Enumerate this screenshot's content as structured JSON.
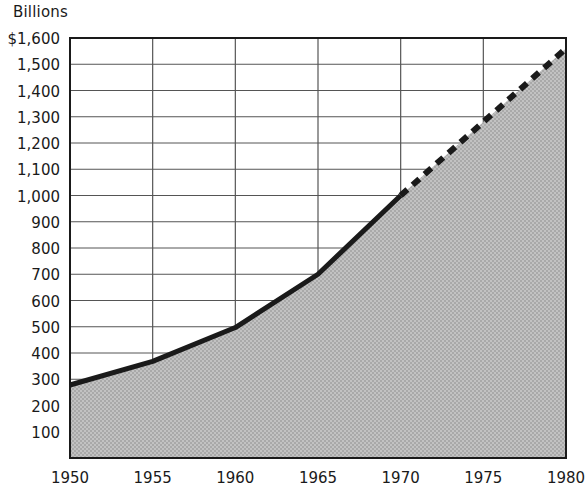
{
  "chart_data": {
    "type": "area",
    "title": "",
    "subtitle": "",
    "units_label": "Billions",
    "xlabel": "",
    "ylabel": "",
    "x": [
      1950,
      1955,
      1960,
      1965,
      1970,
      1975,
      1980
    ],
    "xlim": [
      1950,
      1980
    ],
    "ylim": [
      0,
      1600
    ],
    "grid": true,
    "legend_position": "none",
    "xtick_labels": [
      "1950",
      "1955",
      "1960",
      "1965",
      "1970",
      "1975",
      "1980"
    ],
    "ytick_labels": [
      "$1,600",
      "1,500",
      "1,400",
      "1,300",
      "1,200",
      "1,100",
      "1,000",
      "900",
      "800",
      "700",
      "600",
      "500",
      "400",
      "300",
      "200",
      "100"
    ],
    "ytick_values": [
      1600,
      1500,
      1400,
      1300,
      1200,
      1100,
      1000,
      900,
      800,
      700,
      600,
      500,
      400,
      300,
      200,
      100
    ],
    "series": [
      {
        "name": "Actual",
        "style": "solid",
        "x": [
          1950,
          1955,
          1960,
          1965,
          1970
        ],
        "values": [
          278,
          368,
          497,
          700,
          1000
        ]
      },
      {
        "name": "Projected",
        "style": "dashed",
        "x": [
          1970,
          1975,
          1980
        ],
        "values": [
          1000,
          1280,
          1560
        ]
      }
    ],
    "colors": {
      "line": "#1a1a1a",
      "fill": "#b9b9b9",
      "grid": "#555555",
      "axis": "#1a1a1a",
      "text": "#1a1a1a",
      "background": "#ffffff"
    }
  },
  "geometry": {
    "plot_left": 70,
    "plot_right": 566,
    "plot_top": 38,
    "plot_bottom": 458
  }
}
